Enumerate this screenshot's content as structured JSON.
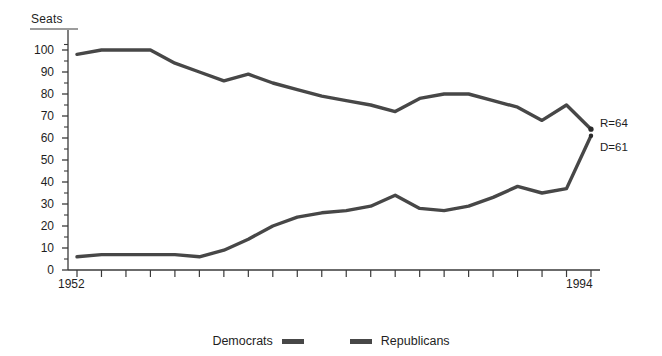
{
  "chart_data": {
    "type": "line",
    "title": "",
    "xlabel": "",
    "ylabel": "Seats",
    "ylim": [
      0,
      105
    ],
    "xlim": [
      1952,
      1994
    ],
    "grid": false,
    "legend_position": "bottom-center",
    "y_ticks": [
      100,
      90,
      80,
      70,
      60,
      50,
      40,
      30,
      20,
      10,
      0
    ],
    "y_minor_tick_step": 5,
    "x_tick_labels": [
      "1952",
      "1994"
    ],
    "x_tick_count": 22,
    "x": [
      1952,
      1954,
      1956,
      1958,
      1960,
      1962,
      1964,
      1966,
      1968,
      1970,
      1972,
      1974,
      1976,
      1978,
      1980,
      1982,
      1984,
      1986,
      1988,
      1990,
      1992,
      1994
    ],
    "series": [
      {
        "name": "Republicans",
        "color": "#474747",
        "values": [
          98,
          100,
          100,
          100,
          94,
          90,
          86,
          89,
          85,
          82,
          79,
          77,
          75,
          72,
          78,
          80,
          80,
          77,
          74,
          68,
          75,
          64
        ]
      },
      {
        "name": "Democrats",
        "color": "#474747",
        "values": [
          6,
          7,
          7,
          7,
          7,
          6,
          9,
          14,
          20,
          24,
          26,
          27,
          29,
          34,
          28,
          27,
          29,
          33,
          38,
          35,
          37,
          61
        ]
      }
    ],
    "annotations": [
      {
        "name": "republican-endpoint",
        "text": "R=64",
        "x": 1994,
        "y": 64
      },
      {
        "name": "democrat-endpoint",
        "text": "D=61",
        "x": 1994,
        "y": 61
      }
    ]
  },
  "legend": {
    "democrats_label": "Democrats",
    "republicans_label": "Republicans"
  },
  "axis": {
    "y_title": "Seats",
    "x_start_label": "1952",
    "x_end_label": "1994"
  },
  "labels": {
    "republicans_end": "R=64",
    "democrats_end": "D=61"
  },
  "colors": {
    "line": "#474747",
    "axis": "#3a3a3a",
    "text": "#1e1e1e",
    "background": "#ffffff"
  }
}
